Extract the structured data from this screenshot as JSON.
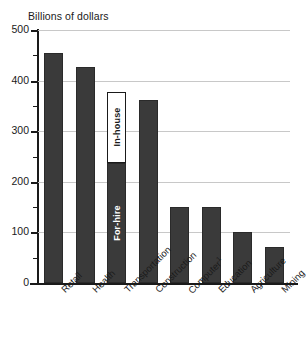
{
  "chart_data": {
    "type": "bar",
    "title": "Billions of dollars",
    "xlabel": "",
    "ylabel": "",
    "ylim": [
      0,
      500
    ],
    "yticks": [
      0,
      100,
      200,
      300,
      400,
      500
    ],
    "ytick_labels": [
      "0",
      "100",
      "200",
      "300",
      "400",
      "500"
    ],
    "yminor_step": 50,
    "grid": true,
    "legend": "none",
    "categories": [
      "Retail",
      "Health",
      "Transportation",
      "Construction",
      "Computer",
      "Education",
      "Agriculture",
      "Mining"
    ],
    "category_footnotes": [
      "",
      "",
      "",
      "",
      "1",
      "",
      "",
      ""
    ],
    "values": [
      455,
      427,
      378,
      362,
      150,
      150,
      101,
      71
    ],
    "stacked_segments": {
      "Transportation": [
        {
          "name": "For-hire",
          "value": 237,
          "style": "solid"
        },
        {
          "name": "In-house",
          "value": 141,
          "style": "hollow"
        }
      ]
    },
    "colors": {
      "bar_fill": "#3a3a3a",
      "bar_stroke": "#2a2a2a",
      "hollow_fill": "#ffffff",
      "hollow_stroke": "#1a1a1a",
      "gridline": "#c8c8c8",
      "axis": "#1a1a1a",
      "text": "#1a1a1a"
    }
  }
}
